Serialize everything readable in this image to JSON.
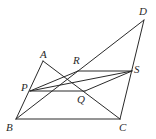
{
  "diagram": {
    "type": "geometry",
    "points": {
      "A": {
        "x": 43,
        "y": 61,
        "label": "A",
        "lx": 40,
        "ly": 58
      },
      "B": {
        "x": 16,
        "y": 119,
        "label": "B",
        "lx": 6,
        "ly": 131
      },
      "C": {
        "x": 120,
        "y": 119,
        "label": "C",
        "lx": 119,
        "ly": 131
      },
      "D": {
        "x": 144,
        "y": 20,
        "label": "D",
        "lx": 139,
        "ly": 15
      },
      "P": {
        "x": 30,
        "y": 91,
        "label": "P",
        "lx": 21,
        "ly": 91
      },
      "Q": {
        "x": 85,
        "y": 91,
        "label": "Q",
        "lx": 77,
        "ly": 103
      },
      "R": {
        "x": 78,
        "y": 71,
        "label": "R",
        "lx": 73,
        "ly": 64
      },
      "S": {
        "x": 132,
        "y": 71,
        "label": "S",
        "lx": 134,
        "ly": 73
      }
    },
    "segments": [
      [
        "A",
        "B"
      ],
      [
        "A",
        "C"
      ],
      [
        "B",
        "C"
      ],
      [
        "B",
        "D"
      ],
      [
        "C",
        "D"
      ],
      [
        "P",
        "R"
      ],
      [
        "R",
        "S"
      ],
      [
        "P",
        "Q"
      ],
      [
        "Q",
        "S"
      ],
      [
        "P",
        "S"
      ]
    ]
  }
}
